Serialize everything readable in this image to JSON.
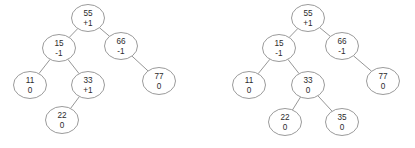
{
  "figure": {
    "node_radius_x": 16.5,
    "node_radius_y": 13.5,
    "stroke_color": "#8f8f8f",
    "edge_color": "#8a8a8a",
    "text_color": "#2b2b2b",
    "background_color": "#ffffff"
  },
  "trees": [
    {
      "id": "left-tree",
      "name": "avl-tree-before",
      "nodes": [
        {
          "id": "L55",
          "key": "55",
          "balance": "+1",
          "cx": 88,
          "cy": 18
        },
        {
          "id": "L15",
          "key": "15",
          "balance": "-1",
          "cx": 59,
          "cy": 48
        },
        {
          "id": "L66",
          "key": "66",
          "balance": "-1",
          "cx": 121,
          "cy": 46
        },
        {
          "id": "L11",
          "key": "11",
          "balance": "0",
          "cx": 30,
          "cy": 85
        },
        {
          "id": "L33",
          "key": "33",
          "balance": "+1",
          "cx": 88,
          "cy": 85
        },
        {
          "id": "L77",
          "key": "77",
          "balance": "0",
          "cx": 159,
          "cy": 81
        },
        {
          "id": "L22",
          "key": "22",
          "balance": "0",
          "cx": 62,
          "cy": 120
        }
      ],
      "edges": [
        {
          "from": "L55",
          "to": "L15"
        },
        {
          "from": "L55",
          "to": "L66"
        },
        {
          "from": "L15",
          "to": "L11"
        },
        {
          "from": "L15",
          "to": "L33"
        },
        {
          "from": "L66",
          "to": "L77"
        },
        {
          "from": "L33",
          "to": "L22"
        }
      ]
    },
    {
      "id": "right-tree",
      "name": "avl-tree-after",
      "nodes": [
        {
          "id": "R55",
          "key": "55",
          "balance": "+1",
          "cx": 308,
          "cy": 18
        },
        {
          "id": "R15",
          "key": "15",
          "balance": "-1",
          "cx": 279,
          "cy": 48
        },
        {
          "id": "R66",
          "key": "66",
          "balance": "-1",
          "cx": 342,
          "cy": 46
        },
        {
          "id": "R11",
          "key": "11",
          "balance": "0",
          "cx": 249,
          "cy": 85
        },
        {
          "id": "R33",
          "key": "33",
          "balance": "0",
          "cx": 308,
          "cy": 85
        },
        {
          "id": "R77",
          "key": "77",
          "balance": "0",
          "cx": 383,
          "cy": 81
        },
        {
          "id": "R22",
          "key": "22",
          "balance": "0",
          "cx": 285,
          "cy": 122
        },
        {
          "id": "R35",
          "key": "35",
          "balance": "0",
          "cx": 342,
          "cy": 122
        }
      ],
      "edges": [
        {
          "from": "R55",
          "to": "R15"
        },
        {
          "from": "R55",
          "to": "R66"
        },
        {
          "from": "R15",
          "to": "R11"
        },
        {
          "from": "R15",
          "to": "R33"
        },
        {
          "from": "R66",
          "to": "R77"
        },
        {
          "from": "R33",
          "to": "R22"
        },
        {
          "from": "R33",
          "to": "R35"
        }
      ]
    }
  ]
}
